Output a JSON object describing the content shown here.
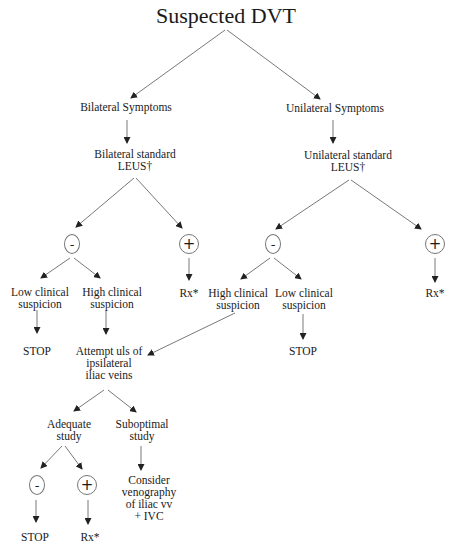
{
  "diagram": {
    "title": "Suspected DVT",
    "nodes": {
      "bilateral_symptoms": "Bilateral Symptoms",
      "unilateral_symptoms": "Unilateral Symptoms",
      "bilateral_leus": "Bilateral standard\nLEUS†",
      "unilateral_leus": "Unilateral  standard\nLEUS†",
      "bil_negative": "-",
      "bil_positive": "+",
      "uni_negative": "-",
      "uni_positive": "+",
      "bil_low_suspicion": "Low clinical\nsuspicion",
      "bil_high_suspicion": "High clinical\nsuspicion",
      "bil_rx": "Rx*",
      "uni_high_suspicion": "High clinical\nsuspicion",
      "uni_low_suspicion": "Low clinical\nsuspicion",
      "uni_rx": "Rx*",
      "bil_stop": "STOP",
      "attempt_uls": "Attempt uls of\nipsilateral\niliac veins",
      "uni_stop": "STOP",
      "adequate_study": "Adequate\nstudy",
      "suboptimal_study": "Suboptimal\nstudy",
      "adequate_negative": "-",
      "adequate_positive": "+",
      "consider_venography": "Consider\nvenography\nof iliac vv\n+ IVC",
      "final_stop": "STOP",
      "final_rx": "Rx*"
    },
    "edges": [
      [
        "title",
        "bilateral_symptoms"
      ],
      [
        "title",
        "unilateral_symptoms"
      ],
      [
        "bilateral_symptoms",
        "bilateral_leus"
      ],
      [
        "unilateral_symptoms",
        "unilateral_leus"
      ],
      [
        "bilateral_leus",
        "bil_negative"
      ],
      [
        "bilateral_leus",
        "bil_positive"
      ],
      [
        "unilateral_leus",
        "uni_negative"
      ],
      [
        "unilateral_leus",
        "uni_positive"
      ],
      [
        "bil_negative",
        "bil_low_suspicion"
      ],
      [
        "bil_negative",
        "bil_high_suspicion"
      ],
      [
        "bil_positive",
        "bil_rx"
      ],
      [
        "uni_negative",
        "uni_high_suspicion"
      ],
      [
        "uni_negative",
        "uni_low_suspicion"
      ],
      [
        "uni_positive",
        "uni_rx"
      ],
      [
        "bil_low_suspicion",
        "bil_stop"
      ],
      [
        "bil_high_suspicion",
        "attempt_uls"
      ],
      [
        "uni_high_suspicion",
        "attempt_uls"
      ],
      [
        "uni_low_suspicion",
        "uni_stop"
      ],
      [
        "attempt_uls",
        "adequate_study"
      ],
      [
        "attempt_uls",
        "suboptimal_study"
      ],
      [
        "suboptimal_study",
        "consider_venography"
      ],
      [
        "adequate_study",
        "adequate_negative"
      ],
      [
        "adequate_study",
        "adequate_positive"
      ],
      [
        "adequate_negative",
        "final_stop"
      ],
      [
        "adequate_positive",
        "final_rx"
      ]
    ]
  }
}
